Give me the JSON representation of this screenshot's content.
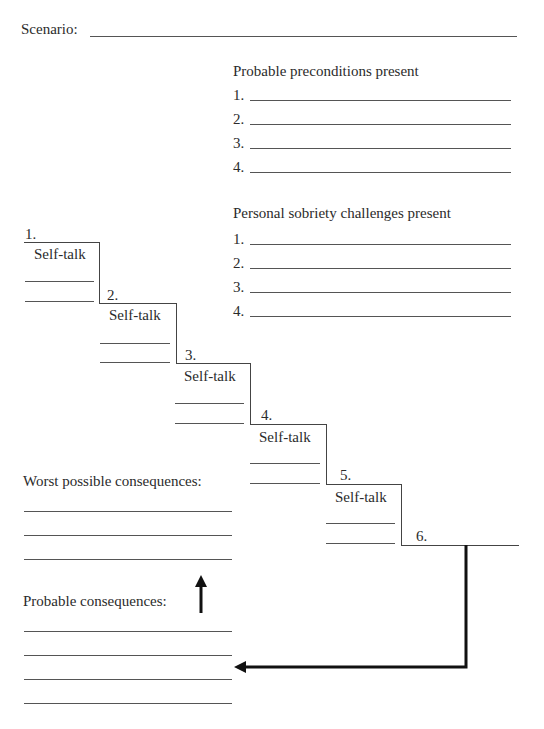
{
  "scenario": {
    "label": "Scenario:",
    "value": ""
  },
  "preconditions": {
    "title": "Probable preconditions present",
    "items": [
      {
        "num": "1.",
        "value": ""
      },
      {
        "num": "2.",
        "value": ""
      },
      {
        "num": "3.",
        "value": ""
      },
      {
        "num": "4.",
        "value": ""
      }
    ]
  },
  "challenges": {
    "title": "Personal sobriety challenges present",
    "items": [
      {
        "num": "1.",
        "value": ""
      },
      {
        "num": "2.",
        "value": ""
      },
      {
        "num": "3.",
        "value": ""
      },
      {
        "num": "4.",
        "value": ""
      }
    ]
  },
  "staircase": {
    "steps": [
      {
        "num": "1.",
        "label": "Self-talk"
      },
      {
        "num": "2.",
        "label": "Self-talk"
      },
      {
        "num": "3.",
        "label": "Self-talk"
      },
      {
        "num": "4.",
        "label": "Self-talk"
      },
      {
        "num": "5.",
        "label": "Self-talk"
      },
      {
        "num": "6.",
        "label": ""
      }
    ]
  },
  "worst_consequences": {
    "label": "Worst possible consequences:",
    "lines": 3
  },
  "probable_consequences": {
    "label": "Probable consequences:",
    "lines": 4
  },
  "icons": {
    "up_arrow": "arrow-up-icon",
    "return_arrow": "arrow-left-icon"
  }
}
